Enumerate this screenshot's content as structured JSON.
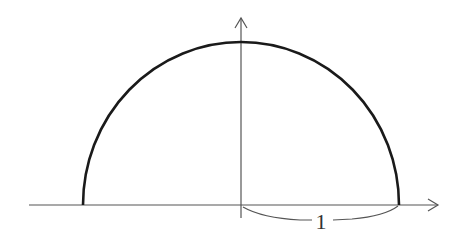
{
  "diagram": {
    "radius_label": "1",
    "colors": {
      "curve": "#1a1a1a",
      "axes": "#555555",
      "label": "#333333"
    }
  }
}
